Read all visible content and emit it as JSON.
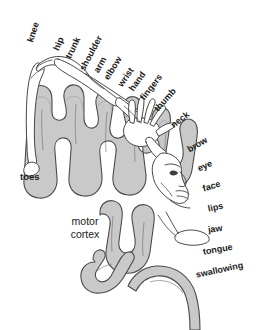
{
  "diagram": {
    "region_label": {
      "line1": "motor",
      "line2": "cortex"
    },
    "colors": {
      "background": "#ffffff",
      "cortex_fill": "#c9c9c9",
      "cortex_stroke": "#4a4a4a",
      "body_fill": "#ffffff",
      "body_stroke": "#3d3d3d",
      "label_text": "#1a1a1a"
    },
    "labels": [
      {
        "text": "knee",
        "x": 30,
        "y": 42,
        "rotate": -72
      },
      {
        "text": "hip",
        "x": 56,
        "y": 50,
        "rotate": -66
      },
      {
        "text": "trunk",
        "x": 68,
        "y": 58,
        "rotate": -64
      },
      {
        "text": "shoulder",
        "x": 82,
        "y": 70,
        "rotate": -62
      },
      {
        "text": "arm",
        "x": 96,
        "y": 72,
        "rotate": -60
      },
      {
        "text": "elbow",
        "x": 106,
        "y": 79,
        "rotate": -58
      },
      {
        "text": "wrist",
        "x": 120,
        "y": 86,
        "rotate": -56
      },
      {
        "text": "hand",
        "x": 131,
        "y": 90,
        "rotate": -54
      },
      {
        "text": "fingers",
        "x": 142,
        "y": 99,
        "rotate": -52
      },
      {
        "text": "thumb",
        "x": 156,
        "y": 110,
        "rotate": -48
      },
      {
        "text": "neck",
        "x": 172,
        "y": 126,
        "rotate": -38
      },
      {
        "text": "brow",
        "x": 188,
        "y": 150,
        "rotate": -30
      },
      {
        "text": "eye",
        "x": 198,
        "y": 169,
        "rotate": -24
      },
      {
        "text": "face",
        "x": 203,
        "y": 189,
        "rotate": -18
      },
      {
        "text": "lips",
        "x": 208,
        "y": 209,
        "rotate": -12
      },
      {
        "text": "jaw",
        "x": 208,
        "y": 230,
        "rotate": -8
      },
      {
        "text": "tongue",
        "x": 203,
        "y": 252,
        "rotate": -10
      },
      {
        "text": "swallowing",
        "x": 196,
        "y": 275,
        "rotate": -12
      }
    ],
    "toes_label": {
      "text": "toes",
      "x": 20,
      "y": 177
    },
    "motor_cortex_label": {
      "x": 85,
      "y": 228
    }
  }
}
